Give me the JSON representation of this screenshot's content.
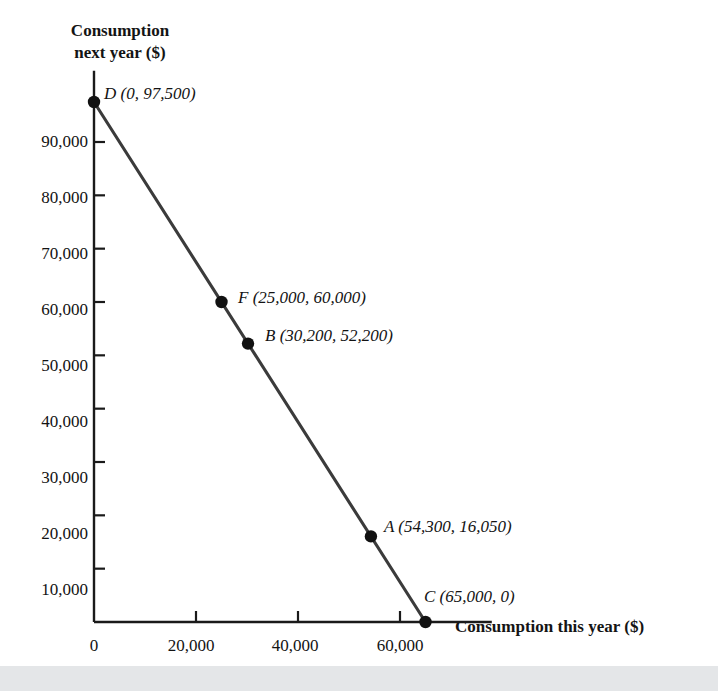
{
  "page": {
    "top_fragment_text": "the DBC.",
    "background_color": "#ffffff",
    "bottom_strip_color": "#e4e6e8"
  },
  "chart_data": {
    "type": "line",
    "title": "",
    "subtitle": "",
    "xlabel": "Consumption this year ($)",
    "ylabel_lines": [
      "Consumption",
      "next year ($)"
    ],
    "ylabel": "Consumption next year ($)",
    "grid": false,
    "legend": "none",
    "line_color": "#3b3b3b",
    "point_color": "#111111",
    "axis_color": "#1a1a1a",
    "xlim": [
      0,
      78000
    ],
    "ylim": [
      0,
      103000
    ],
    "xticks": [
      0,
      20000,
      40000,
      60000
    ],
    "xtick_labels": [
      "0",
      "20,000",
      "40,000",
      "60,000"
    ],
    "yticks": [
      10000,
      20000,
      30000,
      40000,
      50000,
      60000,
      70000,
      80000,
      90000
    ],
    "ytick_labels": [
      "10,000",
      "20,000",
      "30,000",
      "40,000",
      "50,000",
      "60,000",
      "70,000",
      "80,000",
      "90,000"
    ],
    "series": [
      {
        "name": "Budget constraint DC",
        "x": [
          0,
          65000
        ],
        "y": [
          97500,
          0
        ]
      }
    ],
    "points": [
      {
        "id": "D",
        "label": "D (0, 97,500)",
        "name": "D",
        "x": 0,
        "y": 97500,
        "label_dx": 12,
        "label_dy": -16
      },
      {
        "id": "F",
        "label": "F (25,000, 60,000)",
        "name": "F",
        "x": 25000,
        "y": 60000,
        "label_dx": 12,
        "label_dy": -16
      },
      {
        "id": "B",
        "label": "B (30,200, 52,200)",
        "name": "B",
        "x": 30200,
        "y": 52200,
        "label_dx": 12,
        "label_dy": -16
      },
      {
        "id": "A",
        "label": "A (54,300, 16,050)",
        "name": "A",
        "x": 54300,
        "y": 16050,
        "label_dx": 12,
        "label_dy": -16
      },
      {
        "id": "C",
        "label": "C (65,000, 0)",
        "name": "C",
        "x": 65000,
        "y": 0,
        "label_dx": 10,
        "label_dy": -22
      }
    ]
  },
  "labels": {
    "point_D": "D (0, 97,500)",
    "point_F": "F (25,000, 60,000)",
    "point_B": "B (30,200, 52,200)",
    "point_A": "A (54,300, 16,050)",
    "point_C": "C (65,000, 0)",
    "x_title": "Consumption this year ($)",
    "y_title_line1": "Consumption",
    "y_title_line2": "next year ($)",
    "x_tick_0": "0",
    "x_tick_20000": "20,000",
    "x_tick_40000": "40,000",
    "x_tick_60000": "60,000",
    "y_tick_10000": "10,000",
    "y_tick_20000": "20,000",
    "y_tick_30000": "30,000",
    "y_tick_40000": "40,000",
    "y_tick_50000": "50,000",
    "y_tick_60000": "60,000",
    "y_tick_70000": "70,000",
    "y_tick_80000": "80,000",
    "y_tick_90000": "90,000"
  }
}
